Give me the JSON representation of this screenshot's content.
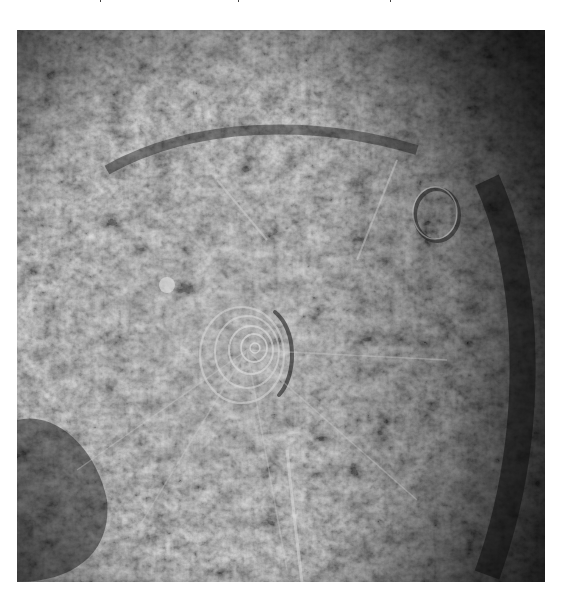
{
  "image": {
    "kind": "grayscale planetary surface photograph",
    "subject": "large impact basin with central concentric ring structure",
    "palette": {
      "background": "#ffffff",
      "shadow": "#141414",
      "midtone": "#6e6e6e",
      "highlight": "#d8d8d8"
    },
    "frame": {
      "x": 17,
      "y": 30,
      "width": 528,
      "height": 552
    },
    "features": {
      "central_rings": {
        "cx": 230,
        "cy": 320,
        "rings": 5
      },
      "secondary_crater": {
        "cx": 420,
        "cy": 185
      },
      "dark_rim_arc": "right side, dark crescent shadow",
      "bright_spot": {
        "cx": 165,
        "cy": 255
      }
    }
  }
}
